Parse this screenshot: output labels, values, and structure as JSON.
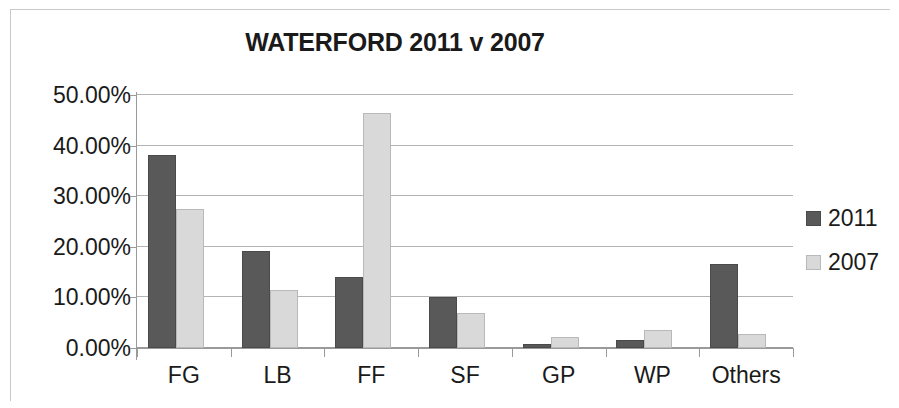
{
  "chart_data": {
    "type": "bar",
    "title": "WATERFORD 2011 v 2007",
    "xlabel": "",
    "ylabel": "",
    "categories": [
      "FG",
      "LB",
      "FF",
      "SF",
      "GP",
      "WP",
      "Others"
    ],
    "series": [
      {
        "name": "2011",
        "color": "#595959",
        "values": [
          38.1,
          19.1,
          14.0,
          10.0,
          0.8,
          1.5,
          16.7
        ]
      },
      {
        "name": "2007",
        "color": "#d9d9d9",
        "values": [
          27.5,
          11.4,
          46.5,
          7.0,
          2.2,
          3.6,
          2.7
        ]
      }
    ],
    "ylim": [
      0,
      50
    ],
    "ytick_values": [
      50,
      40,
      30,
      20,
      10,
      0
    ],
    "ytick_labels": [
      "50.00%",
      "40.00%",
      "30.00%",
      "20.00%",
      "10.00%",
      "0.00%"
    ],
    "grid": "horizontal",
    "legend_position": "right",
    "legend_entries": [
      "2011",
      "2007"
    ],
    "value_suffix": "%"
  }
}
